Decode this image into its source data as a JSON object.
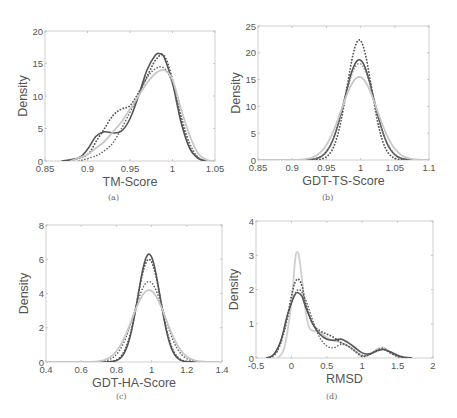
{
  "figure": {
    "captions": [
      "(a)",
      "(b)",
      "(c)",
      "(d)"
    ]
  },
  "chart_data": [
    {
      "type": "line",
      "panel": "(a)",
      "title": "",
      "xlabel": "TM-Score",
      "ylabel": "Density",
      "xlim": [
        0.85,
        1.05
      ],
      "ylim": [
        0,
        20
      ],
      "xticks": [
        0.85,
        0.9,
        0.95,
        1,
        1.05
      ],
      "xtick_labels": [
        "0.85",
        "0.9",
        "0.95",
        "1",
        "1.05"
      ],
      "yticks": [
        0,
        5,
        10,
        15,
        20
      ],
      "ytick_labels": [
        "0",
        "5",
        "10",
        "15",
        "20"
      ],
      "grid": false,
      "box": [
        45,
        31,
        215,
        161
      ],
      "series": [
        {
          "name": "solid-dark",
          "style": "solid",
          "color": "#555555",
          "width": 1.6,
          "x": [
            0.87,
            0.89,
            0.9,
            0.91,
            0.92,
            0.93,
            0.94,
            0.95,
            0.96,
            0.97,
            0.98,
            0.985,
            0.99,
            1.0,
            1.01,
            1.02,
            1.03,
            1.04
          ],
          "y": [
            0,
            0.5,
            1.8,
            3.8,
            4.5,
            4.3,
            4.6,
            6.5,
            10,
            14,
            16.3,
            16.5,
            16,
            12,
            6,
            2,
            0.4,
            0
          ]
        },
        {
          "name": "dotted-dark",
          "style": "dotted",
          "color": "#555555",
          "width": 1.8,
          "x": [
            0.88,
            0.9,
            0.91,
            0.92,
            0.93,
            0.94,
            0.95,
            0.96,
            0.97,
            0.98,
            0.99,
            1.0,
            1.01,
            1.02,
            1.03,
            1.04
          ],
          "y": [
            0,
            1,
            3,
            5,
            7,
            8,
            8.5,
            10.5,
            13,
            15.5,
            16.2,
            12.5,
            6.5,
            2.2,
            0.5,
            0
          ]
        },
        {
          "name": "dotted-dark-2",
          "style": "dotted",
          "color": "#666666",
          "width": 1.6,
          "x": [
            0.89,
            0.91,
            0.92,
            0.93,
            0.94,
            0.95,
            0.96,
            0.97,
            0.98,
            0.99,
            1.0,
            1.01,
            1.02,
            1.03,
            1.04
          ],
          "y": [
            0,
            0.8,
            1.6,
            2.8,
            5,
            7.5,
            10,
            12.8,
            14.2,
            14.3,
            12,
            7,
            2.8,
            0.6,
            0
          ]
        },
        {
          "name": "solid-light",
          "style": "solid",
          "color": "#c8c8c8",
          "width": 1.8,
          "x": [
            0.88,
            0.9,
            0.91,
            0.92,
            0.93,
            0.94,
            0.95,
            0.96,
            0.97,
            0.98,
            0.99,
            1.0,
            1.01,
            1.02,
            1.03,
            1.04,
            1.05
          ],
          "y": [
            0,
            1,
            2,
            3,
            4.5,
            6,
            8,
            10,
            12,
            13.5,
            14,
            12.5,
            8,
            4,
            1.2,
            0.2,
            0
          ]
        }
      ]
    },
    {
      "type": "line",
      "panel": "(b)",
      "title": "",
      "xlabel": "GDT-TS-Score",
      "ylabel": "Density",
      "xlim": [
        0.85,
        1.1
      ],
      "ylim": [
        0,
        25
      ],
      "xticks": [
        0.85,
        0.9,
        0.95,
        1,
        1.05,
        1.1
      ],
      "xtick_labels": [
        "0.85",
        "0.9",
        "0.95",
        "1",
        "1.05",
        "1.1"
      ],
      "yticks": [
        0,
        5,
        10,
        15,
        20,
        25
      ],
      "ytick_labels": [
        "0",
        "5",
        "10",
        "15",
        "20",
        "25"
      ],
      "grid": false,
      "box": [
        258,
        26,
        429,
        160
      ],
      "series": [
        {
          "name": "dotted-dark",
          "style": "dotted",
          "color": "#555555",
          "width": 1.8,
          "gauss": {
            "mu": 0.998,
            "sigma": 0.0178,
            "peak": 22.4
          }
        },
        {
          "name": "solid-dark",
          "style": "solid",
          "color": "#555555",
          "width": 1.6,
          "gauss": {
            "mu": 0.998,
            "sigma": 0.0215,
            "peak": 18.7
          }
        },
        {
          "name": "dotted-mid",
          "style": "dotted",
          "color": "#777777",
          "width": 1.4,
          "gauss": {
            "mu": 0.998,
            "sigma": 0.022,
            "peak": 18.0
          }
        },
        {
          "name": "solid-light",
          "style": "solid",
          "color": "#c8c8c8",
          "width": 1.8,
          "gauss": {
            "mu": 0.998,
            "sigma": 0.026,
            "peak": 15.5
          }
        }
      ]
    },
    {
      "type": "line",
      "panel": "(c)",
      "title": "",
      "xlabel": "GDT-HA-Score",
      "ylabel": "Density",
      "xlim": [
        0.4,
        1.4
      ],
      "ylim": [
        0,
        8
      ],
      "xticks": [
        0.4,
        0.6,
        0.8,
        1,
        1.2,
        1.4
      ],
      "xtick_labels": [
        "0.4",
        "0.6",
        "0.8",
        "1",
        "1.2",
        "1.4"
      ],
      "yticks": [
        0,
        2,
        4,
        6,
        8
      ],
      "ytick_labels": [
        "0",
        "2",
        "4",
        "6",
        "8"
      ],
      "grid": false,
      "box": [
        46,
        225,
        222,
        362
      ],
      "series": [
        {
          "name": "solid-dark",
          "style": "solid",
          "color": "#555555",
          "width": 1.6,
          "gauss": {
            "mu": 0.985,
            "sigma": 0.063,
            "peak": 6.3
          }
        },
        {
          "name": "dotted-dark",
          "style": "dotted",
          "color": "#555555",
          "width": 1.8,
          "gauss": {
            "mu": 0.985,
            "sigma": 0.066,
            "peak": 6.0
          }
        },
        {
          "name": "dotted-mid",
          "style": "dotted",
          "color": "#666666",
          "width": 1.6,
          "gauss": {
            "mu": 0.985,
            "sigma": 0.085,
            "peak": 4.7
          }
        },
        {
          "name": "solid-light",
          "style": "solid",
          "color": "#c8c8c8",
          "width": 1.8,
          "gauss": {
            "mu": 0.985,
            "sigma": 0.095,
            "peak": 4.2
          }
        }
      ]
    },
    {
      "type": "line",
      "panel": "(d)",
      "title": "",
      "xlabel": "RMSD",
      "ylabel": "Density",
      "xlim": [
        -0.5,
        2
      ],
      "ylim": [
        0,
        4
      ],
      "xticks": [
        -0.5,
        0,
        0.5,
        1,
        1.5,
        2
      ],
      "xtick_labels": [
        "-0.5",
        "0",
        "0.5",
        "1",
        "1.5",
        "2"
      ],
      "yticks": [
        0,
        1,
        2,
        3,
        4
      ],
      "ytick_labels": [
        "0",
        "1",
        "2",
        "3",
        "4"
      ],
      "grid": false,
      "box": [
        256,
        221,
        433,
        358
      ],
      "series": [
        {
          "name": "solid-light",
          "style": "solid",
          "color": "#cfcfcf",
          "width": 1.8,
          "x": [
            -0.2,
            -0.1,
            0,
            0.05,
            0.08,
            0.12,
            0.2,
            0.25,
            0.3,
            0.4,
            0.5,
            0.6,
            0.7,
            0.8,
            0.9,
            1.0,
            1.1,
            1.2,
            1.3,
            1.4,
            1.5,
            1.6
          ],
          "y": [
            0,
            0.3,
            1.6,
            2.8,
            3.1,
            2.8,
            1.4,
            0.9,
            0.8,
            0.75,
            0.6,
            0.5,
            0.45,
            0.35,
            0.2,
            0.05,
            0.1,
            0.25,
            0.3,
            0.15,
            0.05,
            0
          ]
        },
        {
          "name": "dotted-dark",
          "style": "dotted",
          "color": "#555555",
          "width": 1.8,
          "x": [
            -0.3,
            -0.2,
            -0.1,
            0,
            0.05,
            0.1,
            0.15,
            0.2,
            0.3,
            0.4,
            0.5,
            0.6,
            0.7,
            0.8,
            0.9,
            1.0,
            1.1,
            1.2,
            1.3,
            1.4,
            1.5,
            1.6
          ],
          "y": [
            0,
            0.2,
            0.8,
            1.8,
            2.2,
            2.3,
            2.1,
            1.6,
            1.0,
            0.8,
            0.7,
            0.6,
            0.45,
            0.35,
            0.2,
            0.05,
            0.1,
            0.2,
            0.25,
            0.15,
            0.05,
            0
          ]
        },
        {
          "name": "dotted-mid",
          "style": "dotted",
          "color": "#666666",
          "width": 1.6,
          "x": [
            -0.3,
            -0.2,
            -0.1,
            0,
            0.1,
            0.2,
            0.3,
            0.4,
            0.5,
            0.6,
            0.7,
            0.8,
            0.9,
            1.0,
            1.1,
            1.2,
            1.3,
            1.4,
            1.5,
            1.6
          ],
          "y": [
            0,
            0.2,
            0.8,
            1.6,
            2.0,
            1.7,
            1.1,
            0.6,
            0.35,
            0.3,
            0.4,
            0.35,
            0.2,
            0.08,
            0.1,
            0.22,
            0.28,
            0.15,
            0.05,
            0
          ]
        },
        {
          "name": "solid-dark",
          "style": "solid",
          "color": "#555555",
          "width": 1.6,
          "x": [
            -0.35,
            -0.25,
            -0.15,
            -0.05,
            0.05,
            0.1,
            0.15,
            0.2,
            0.3,
            0.4,
            0.5,
            0.6,
            0.7,
            0.8,
            0.9,
            1.0,
            1.1,
            1.2,
            1.3,
            1.4,
            1.5,
            1.6,
            1.7
          ],
          "y": [
            0,
            0.1,
            0.5,
            1.3,
            1.85,
            1.9,
            1.8,
            1.5,
            1.0,
            0.7,
            0.55,
            0.52,
            0.55,
            0.45,
            0.3,
            0.15,
            0.12,
            0.2,
            0.25,
            0.18,
            0.08,
            0.02,
            0
          ]
        }
      ]
    }
  ]
}
